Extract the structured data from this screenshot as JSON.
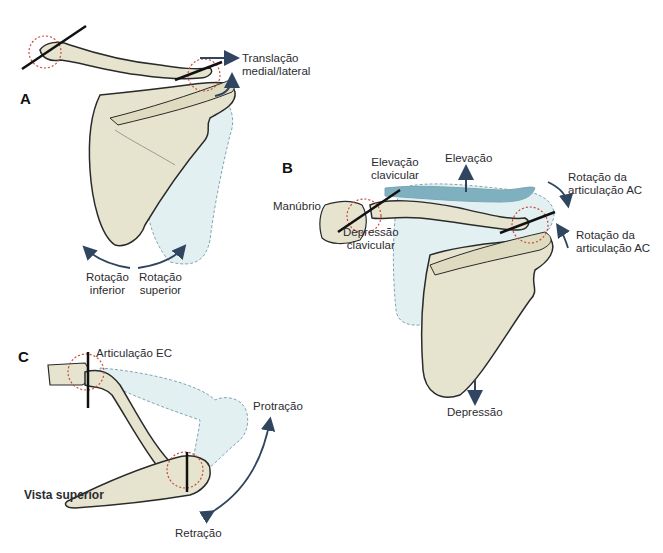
{
  "colors": {
    "bone_fill": "#e6e4cf",
    "bone_shadow": "#cfcaa6",
    "outline": "#2a2a2a",
    "ghost_fill": "#e3f0f2",
    "ghost_outline": "#7fa6b3",
    "elevation_fill": "#7fb0bf",
    "joint_circle": "#cc4a3a",
    "arrow": "#2f4560"
  },
  "panels": {
    "A": {
      "letter": "A",
      "labels": {
        "translation_1": "Translação",
        "translation_2": "medial/lateral",
        "inf_rot_1": "Rotação",
        "inf_rot_2": "inferior",
        "sup_rot_1": "Rotação",
        "sup_rot_2": "superior"
      }
    },
    "B": {
      "letter": "B",
      "labels": {
        "manubrium": "Manúbrio",
        "clav_elev_1": "Elevação",
        "clav_elev_2": "clavicular",
        "elevation": "Elevação",
        "ac_rot_top_1": "Rotação da",
        "ac_rot_top_2": "articulação AC",
        "ac_rot_bot_1": "Rotação da",
        "ac_rot_bot_2": "articulação AC",
        "clav_dep_1": "Depressão",
        "clav_dep_2": "clavicular",
        "depression": "Depressão"
      }
    },
    "C": {
      "letter": "C",
      "labels": {
        "ec_joint": "Articulação EC",
        "superior_view": "Vista superior",
        "protraction": "Protração",
        "retraction": "Retração"
      }
    }
  }
}
